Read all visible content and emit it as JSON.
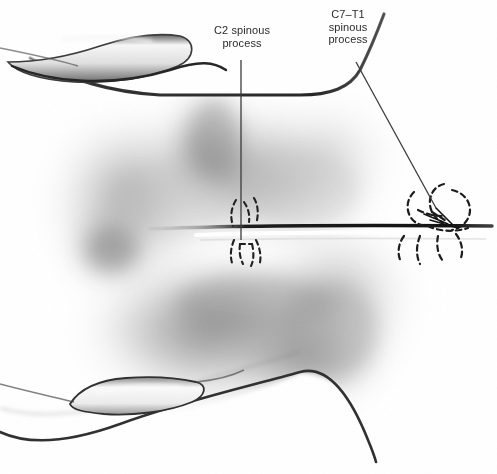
{
  "figure": {
    "medium": "airbrush-charcoal-rendering",
    "background_color": "#ffffff",
    "ink_color": "#2b2b2b",
    "width": 497,
    "height": 474
  },
  "labels": {
    "c2": {
      "text": "C2 spinous\nprocess",
      "line1": "C2 spinous",
      "line2": "process",
      "leader_from_x": 241,
      "leader_from_y": 60,
      "leader_to_x": 241,
      "leader_to_y": 240
    },
    "c7t1": {
      "text": "C7–T1\nspinous\nprocess",
      "line1": "C7–T1",
      "line2": "spinous",
      "line3": "process",
      "leader_from_x": 356,
      "leader_from_y": 62,
      "leader_to_x": 436,
      "leader_to_y": 208
    }
  },
  "structures": {
    "spine_midline": {
      "name": "spinous process line",
      "from_x": 150,
      "from_y": 228,
      "to_x": 492,
      "to_y": 226,
      "color": "#141414"
    },
    "bone_ridge_upper": {
      "name": "upper highlighted bony ridge",
      "color": "#f2f2f2"
    },
    "bone_ridge_lower": {
      "name": "lower highlighted bony ridge",
      "color": "#f4f4f4"
    },
    "vertebra_outlines_left": {
      "name": "C2 dashed vertebra outline",
      "style": "dashed",
      "center_x": 250,
      "center_y": 228
    },
    "vertebra_outlines_right": {
      "name": "C7-T1 dashed vertebra outline",
      "style": "dashed",
      "center_x": 440,
      "center_y": 228
    }
  },
  "shading": {
    "darkest_tone": "#8a8a8a",
    "mid_tone": "#b8b8b8",
    "light_tone": "#dcdcdc"
  }
}
